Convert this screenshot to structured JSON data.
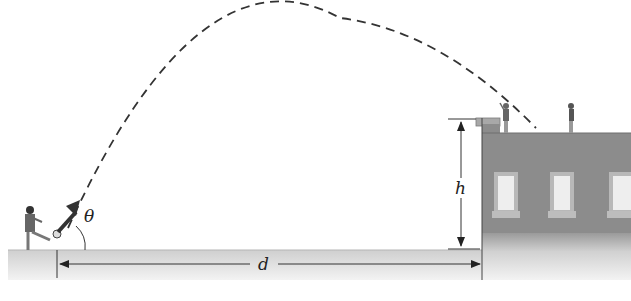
{
  "diagram": {
    "type": "projectile-motion",
    "labels": {
      "angle": "θ",
      "height": "h",
      "distance": "d"
    },
    "colors": {
      "trajectory": "#333333",
      "building": "#8a8a8a",
      "ground": "#d9d9d9",
      "window_frame": "#bdbdbd",
      "window_glass": "#eeeeee"
    },
    "elements": [
      "kicker",
      "ball",
      "velocity-arrow",
      "trajectory",
      "building",
      "person-on-roof-1",
      "person-on-roof-2",
      "height-dimension",
      "distance-dimension"
    ]
  }
}
